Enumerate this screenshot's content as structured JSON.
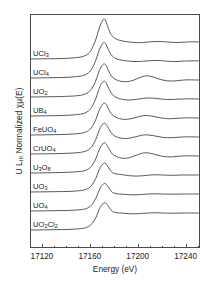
{
  "figure": {
    "axes": {
      "xlabel": "Energy (eV)",
      "ylabel_main": "U L",
      "ylabel_sub": "III",
      "ylabel_rest": " Normalized χμ(E)",
      "ylabel_full": "U L₃ Normalized χμ(E)",
      "xticks": [
        "17120",
        "17160",
        "17200",
        "17240"
      ],
      "xtick_values": [
        17120,
        17160,
        17200,
        17240
      ],
      "xlim": [
        17110,
        17252
      ],
      "grid": false,
      "frame": true,
      "yticks": []
    },
    "series_labels": [
      {
        "text": "UCl",
        "sub": "3"
      },
      {
        "text": "UCl",
        "sub": "4"
      },
      {
        "text": "UO",
        "sub": "2"
      },
      {
        "text": "UB",
        "sub": "4"
      },
      {
        "text": "FeUO",
        "sub": "4"
      },
      {
        "text": "CrUO",
        "sub": "4"
      },
      {
        "text": "U",
        "sub": "3",
        "text2": "O",
        "sub2": "8"
      },
      {
        "text": "UO",
        "sub": "3"
      },
      {
        "text": "UO",
        "sub": "4"
      },
      {
        "text": "UO",
        "sub": "2",
        "text2": "Cl",
        "sub2": "2"
      }
    ],
    "line_color": "#3c3c3c",
    "frame_color": "#4a4a4a"
  },
  "chart_data": {
    "type": "line",
    "title": "",
    "subtitle": "",
    "xlabel": "Energy (eV)",
    "ylabel": "U L₃ Normalized χμ(E)",
    "xlim": [
      17110,
      17252
    ],
    "ylim": [
      0,
      10.6
    ],
    "grid": false,
    "legend": "inline-labels-left",
    "stacked_offset": 1.0,
    "x": [
      17110,
      17120,
      17130,
      17140,
      17148,
      17154,
      17158,
      17161,
      17164,
      17166,
      17168,
      17170,
      17171,
      17172,
      17173,
      17174,
      17176,
      17178,
      17181,
      17184,
      17188,
      17192,
      17196,
      17200,
      17204,
      17208,
      17212,
      17216,
      17220,
      17224,
      17228,
      17232,
      17236,
      17240,
      17244,
      17248,
      17252
    ],
    "series": [
      {
        "name": "UCl3",
        "label": "UCl₃",
        "edge_energy_eV": 17166,
        "white_line_eV": 17171.5,
        "white_line_height": 2.35,
        "values": [
          0.0,
          0.01,
          0.02,
          0.04,
          0.08,
          0.16,
          0.32,
          0.62,
          1.12,
          1.58,
          2.0,
          2.28,
          2.35,
          2.3,
          2.14,
          1.92,
          1.56,
          1.34,
          1.18,
          1.1,
          1.04,
          1.0,
          0.97,
          0.96,
          0.97,
          1.0,
          1.02,
          1.03,
          1.02,
          1.0,
          0.98,
          0.97,
          0.98,
          1.0,
          1.01,
          1.01,
          1.0
        ]
      },
      {
        "name": "UCl4",
        "label": "UCl₄",
        "edge_energy_eV": 17167,
        "white_line_eV": 17172.0,
        "white_line_height": 2.1,
        "values": [
          0.0,
          0.01,
          0.02,
          0.04,
          0.08,
          0.15,
          0.3,
          0.56,
          1.02,
          1.45,
          1.82,
          2.04,
          2.1,
          2.06,
          1.94,
          1.76,
          1.48,
          1.28,
          1.14,
          1.07,
          1.02,
          0.99,
          0.97,
          0.97,
          0.99,
          1.01,
          1.03,
          1.03,
          1.01,
          0.99,
          0.97,
          0.97,
          0.99,
          1.0,
          1.01,
          1.01,
          1.0
        ]
      },
      {
        "name": "UO2",
        "label": "UO₂",
        "edge_energy_eV": 17168,
        "white_line_eV": 17172.5,
        "white_line_height": 1.95,
        "values": [
          0.0,
          0.01,
          0.02,
          0.04,
          0.07,
          0.14,
          0.28,
          0.52,
          0.94,
          1.34,
          1.7,
          1.9,
          1.95,
          1.92,
          1.82,
          1.66,
          1.38,
          1.16,
          1.02,
          0.94,
          0.9,
          0.92,
          1.0,
          1.12,
          1.22,
          1.24,
          1.18,
          1.08,
          1.0,
          0.95,
          0.94,
          0.96,
          0.99,
          1.01,
          1.01,
          1.0,
          1.0
        ]
      },
      {
        "name": "UB4",
        "label": "UB₄",
        "edge_energy_eV": 17166,
        "white_line_eV": 17172.0,
        "white_line_height": 2.05,
        "values": [
          0.0,
          0.01,
          0.02,
          0.04,
          0.08,
          0.15,
          0.3,
          0.56,
          1.0,
          1.42,
          1.8,
          2.0,
          2.05,
          2.02,
          1.92,
          1.76,
          1.48,
          1.26,
          1.1,
          1.02,
          0.96,
          0.94,
          0.96,
          1.0,
          1.04,
          1.06,
          1.05,
          1.02,
          0.99,
          0.97,
          0.97,
          0.99,
          1.0,
          1.01,
          1.01,
          1.0,
          1.0
        ]
      },
      {
        "name": "FeUO4",
        "label": "FeUO₄",
        "edge_energy_eV": 17169,
        "white_line_eV": 17173.0,
        "white_line_height": 1.88,
        "values": [
          0.0,
          0.01,
          0.02,
          0.04,
          0.07,
          0.13,
          0.26,
          0.48,
          0.88,
          1.28,
          1.62,
          1.82,
          1.88,
          1.86,
          1.78,
          1.64,
          1.38,
          1.18,
          1.04,
          0.96,
          0.92,
          0.94,
          1.0,
          1.08,
          1.14,
          1.14,
          1.1,
          1.04,
          0.99,
          0.96,
          0.96,
          0.98,
          1.0,
          1.01,
          1.01,
          1.0,
          1.0
        ]
      },
      {
        "name": "CrUO4",
        "label": "CrUO₄",
        "edge_energy_eV": 17169,
        "white_line_eV": 17173.0,
        "white_line_height": 1.82,
        "values": [
          0.0,
          0.01,
          0.02,
          0.04,
          0.07,
          0.13,
          0.25,
          0.46,
          0.84,
          1.22,
          1.56,
          1.76,
          1.82,
          1.8,
          1.72,
          1.6,
          1.36,
          1.16,
          1.02,
          0.95,
          0.91,
          0.93,
          0.99,
          1.06,
          1.12,
          1.12,
          1.08,
          1.03,
          0.98,
          0.96,
          0.96,
          0.98,
          1.0,
          1.01,
          1.01,
          1.0,
          1.0
        ]
      },
      {
        "name": "U3O8",
        "label": "U₃O₈",
        "edge_energy_eV": 17169,
        "white_line_eV": 17173.0,
        "white_line_height": 1.78,
        "values": [
          0.0,
          0.01,
          0.02,
          0.04,
          0.07,
          0.12,
          0.24,
          0.45,
          0.82,
          1.2,
          1.52,
          1.72,
          1.78,
          1.76,
          1.68,
          1.56,
          1.32,
          1.12,
          0.98,
          0.9,
          0.86,
          0.9,
          0.99,
          1.1,
          1.18,
          1.18,
          1.12,
          1.04,
          0.98,
          0.95,
          0.95,
          0.98,
          1.0,
          1.01,
          1.01,
          1.0,
          1.0
        ]
      },
      {
        "name": "UO3",
        "label": "UO₃",
        "edge_energy_eV": 17170,
        "white_line_eV": 17173.5,
        "white_line_height": 1.7,
        "shoulder_eV": 17182,
        "values": [
          0.0,
          0.01,
          0.02,
          0.03,
          0.06,
          0.11,
          0.22,
          0.42,
          0.78,
          1.14,
          1.46,
          1.64,
          1.7,
          1.69,
          1.62,
          1.52,
          1.3,
          1.14,
          1.06,
          1.04,
          1.0,
          0.96,
          0.94,
          0.94,
          0.96,
          0.99,
          1.01,
          1.01,
          1.0,
          0.99,
          0.98,
          0.99,
          1.0,
          1.0,
          1.0,
          1.0,
          1.0
        ]
      },
      {
        "name": "UO4",
        "label": "UO₄",
        "edge_energy_eV": 17170,
        "white_line_eV": 17174.0,
        "white_line_height": 1.62,
        "values": [
          0.0,
          0.01,
          0.02,
          0.03,
          0.06,
          0.1,
          0.2,
          0.38,
          0.72,
          1.06,
          1.38,
          1.56,
          1.62,
          1.62,
          1.56,
          1.46,
          1.26,
          1.1,
          1.02,
          1.0,
          0.98,
          0.96,
          0.95,
          0.96,
          0.98,
          1.0,
          1.01,
          1.01,
          1.0,
          0.99,
          0.99,
          0.99,
          1.0,
          1.0,
          1.0,
          1.0,
          1.0
        ]
      },
      {
        "name": "UO2Cl2",
        "label": "UO₂Cl₂",
        "edge_energy_eV": 17170,
        "white_line_eV": 17174.0,
        "white_line_height": 1.6,
        "values": [
          0.0,
          0.01,
          0.02,
          0.03,
          0.06,
          0.1,
          0.2,
          0.38,
          0.7,
          1.04,
          1.36,
          1.54,
          1.6,
          1.6,
          1.55,
          1.46,
          1.26,
          1.1,
          1.02,
          1.0,
          0.98,
          0.96,
          0.95,
          0.96,
          0.98,
          1.0,
          1.01,
          1.01,
          1.0,
          0.99,
          0.99,
          0.99,
          1.0,
          1.0,
          1.0,
          1.0,
          1.0
        ]
      }
    ]
  }
}
